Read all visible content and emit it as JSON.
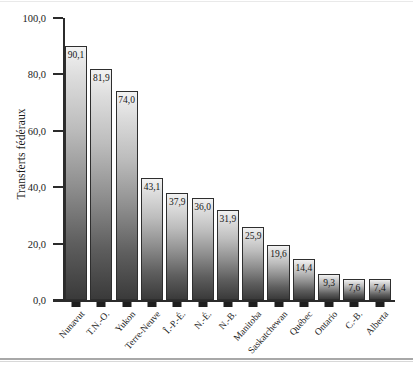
{
  "chart_data": {
    "type": "bar",
    "title": "",
    "xlabel": "",
    "ylabel": "Transferts fédéraux",
    "ylim": [
      0,
      100
    ],
    "ytick_labels": [
      "0,0",
      "20,0",
      "40,0",
      "60,0",
      "80,0",
      "100,0"
    ],
    "ytick_values": [
      0,
      20,
      40,
      60,
      80,
      100
    ],
    "grid": false,
    "legend": null,
    "decimal_separator": ",",
    "categories": [
      "Nunavut",
      "T.N.-O.",
      "Yukon",
      "Terre-Neuve",
      "Î.-P.-É.",
      "N.-É.",
      "N.-B.",
      "Manitoba",
      "Saskatchewan",
      "Québec",
      "Ontario",
      "C.-B.",
      "Alberta"
    ],
    "values": [
      90.1,
      81.9,
      74.0,
      43.1,
      37.9,
      36.0,
      31.9,
      25.9,
      19.6,
      14.4,
      9.3,
      7.6,
      7.4
    ],
    "value_labels": [
      "90,1",
      "81,9",
      "74,0",
      "43,1",
      "37,9",
      "36,0",
      "31,9",
      "25,9",
      "19,6",
      "14,4",
      "9,3",
      "7,6",
      "7,4"
    ],
    "bar_style": {
      "fill_top_color": "#f2f2f2",
      "fill_bottom_color": "#3a3a3a",
      "border_color": "#2e2e2e"
    },
    "axis_color": "#2b2b2b",
    "background_color": "#ffffff"
  }
}
